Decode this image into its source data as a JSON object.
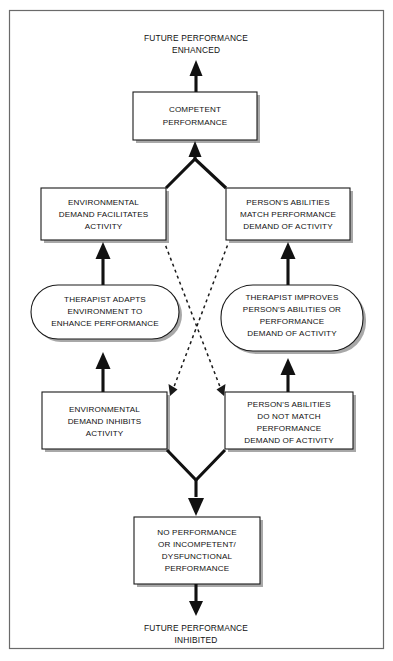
{
  "diagram": {
    "title_top": {
      "lines": [
        "FUTURE PERFORMANCE",
        "ENHANCED"
      ]
    },
    "title_bottom": {
      "lines": [
        "FUTURE PERFORMANCE",
        "INHIBITED"
      ]
    },
    "nodes": {
      "competent_performance": {
        "shape": "rectangle",
        "lines": [
          "COMPETENT",
          "PERFORMANCE"
        ]
      },
      "env_demand_facilitates": {
        "shape": "rectangle",
        "lines": [
          "ENVIRONMENTAL",
          "DEMAND FACILITATES",
          "ACTIVITY"
        ]
      },
      "abilities_match": {
        "shape": "rectangle",
        "lines": [
          "PERSON'S ABILITIES",
          "MATCH PERFORMANCE",
          "DEMAND OF ACTIVITY"
        ]
      },
      "therapist_adapts_environment": {
        "shape": "rounded",
        "lines": [
          "THERAPIST ADAPTS",
          "ENVIRONMENT TO",
          "ENHANCE PERFORMANCE"
        ]
      },
      "therapist_improves_abilities": {
        "shape": "rounded",
        "lines": [
          "THERAPIST IMPROVES",
          "PERSON'S ABILITIES OR",
          "PERFORMANCE",
          "DEMAND OF ACTIVITY"
        ]
      },
      "env_demand_inhibits": {
        "shape": "rectangle",
        "lines": [
          "ENVIRONMENTAL",
          "DEMAND INHIBITS",
          "ACTIVITY"
        ]
      },
      "abilities_do_not_match": {
        "shape": "rectangle",
        "lines": [
          "PERSON'S ABILITIES",
          "DO NOT MATCH",
          "PERFORMANCE",
          "DEMAND OF ACTIVITY"
        ]
      },
      "no_performance": {
        "shape": "rectangle",
        "lines": [
          "NO PERFORMANCE",
          "OR INCOMPETENT/",
          "DYSFUNCTIONAL",
          "PERFORMANCE"
        ]
      }
    },
    "colors": {
      "stroke": "#1a1a1a",
      "frame": "#6a6a6a",
      "shadow": "#a8a8a8",
      "background": "#ffffff",
      "text": "#111111"
    }
  }
}
